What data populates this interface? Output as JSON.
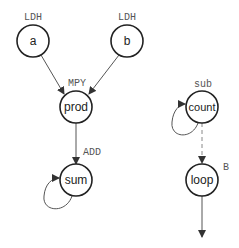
{
  "diagram": {
    "type": "dataflow-graph",
    "nodes": [
      {
        "id": "a",
        "label": "a",
        "op": "LDH"
      },
      {
        "id": "b",
        "label": "b",
        "op": "LDH"
      },
      {
        "id": "prod",
        "label": "prod",
        "op": "MPY"
      },
      {
        "id": "sum",
        "label": "sum",
        "op": "ADD"
      },
      {
        "id": "count",
        "label": "count",
        "op": "sub"
      },
      {
        "id": "loop",
        "label": "loop",
        "op": "B"
      }
    ],
    "edges": [
      {
        "from": "a",
        "to": "prod",
        "style": "solid"
      },
      {
        "from": "b",
        "to": "prod",
        "style": "solid"
      },
      {
        "from": "prod",
        "to": "sum",
        "style": "solid"
      },
      {
        "from": "sum",
        "to": "sum",
        "style": "solid",
        "self_loop": true
      },
      {
        "from": "count",
        "to": "count",
        "style": "solid",
        "self_loop": true
      },
      {
        "from": "count",
        "to": "loop",
        "style": "dashed"
      },
      {
        "from": "loop",
        "to": "out",
        "style": "solid"
      }
    ]
  }
}
